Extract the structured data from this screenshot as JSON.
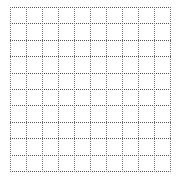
{
  "grid": {
    "rows": 10,
    "cols": 10,
    "origin_x": 10,
    "origin_y": 7,
    "cell_width": 16,
    "cell_height": 16.4,
    "line_style": "dotted",
    "h_line_color": "#555555",
    "v_line_color": "#777777",
    "background": "#ffffff"
  }
}
